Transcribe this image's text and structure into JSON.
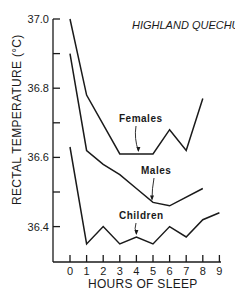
{
  "chart_data": {
    "type": "line",
    "title": "HIGHLAND QUECHUA",
    "xlabel": "HOURS OF SLEEP",
    "ylabel": "RECTAL TEMPERATURE (°C)",
    "xlim": [
      0,
      9
    ],
    "ylim": [
      36.3,
      37.0
    ],
    "x_ticks": [
      0,
      1,
      2,
      3,
      4,
      5,
      6,
      7,
      8,
      9
    ],
    "x_tick_labels": [
      "0",
      "1",
      "2",
      "3",
      "4",
      "5",
      "6",
      "7",
      "8",
      "9"
    ],
    "y_ticks": [
      36.4,
      36.5,
      36.6,
      36.7,
      36.8,
      36.9,
      37.0
    ],
    "y_tick_labels": [
      "36.4",
      "",
      "36.6",
      "",
      "36.8",
      "",
      "37.0"
    ],
    "grid": false,
    "legend_position": "inline annotations with arrows",
    "series": [
      {
        "name": "Females",
        "x": [
          0,
          1,
          3,
          5,
          6,
          7,
          8
        ],
        "values": [
          37.0,
          36.78,
          36.61,
          36.61,
          36.68,
          36.62,
          36.77
        ]
      },
      {
        "name": "Males",
        "x": [
          0,
          1,
          2,
          3,
          4,
          5,
          6,
          8
        ],
        "values": [
          36.9,
          36.62,
          36.58,
          36.55,
          36.51,
          36.47,
          36.46,
          36.51
        ]
      },
      {
        "name": "Children",
        "x": [
          0,
          1,
          2,
          3,
          4,
          5,
          6,
          7,
          8,
          9
        ],
        "values": [
          36.63,
          36.35,
          36.4,
          36.35,
          36.37,
          36.35,
          36.4,
          36.37,
          36.42,
          36.44
        ]
      }
    ],
    "annotations": [
      {
        "text": "Females",
        "x": 4,
        "y": 36.61
      },
      {
        "text": "Males",
        "x": 5,
        "y": 36.47
      },
      {
        "text": "Children",
        "x": 4,
        "y": 36.37
      }
    ]
  },
  "colors": {
    "ink": "#1a1a1a",
    "background": "#ffffff"
  }
}
